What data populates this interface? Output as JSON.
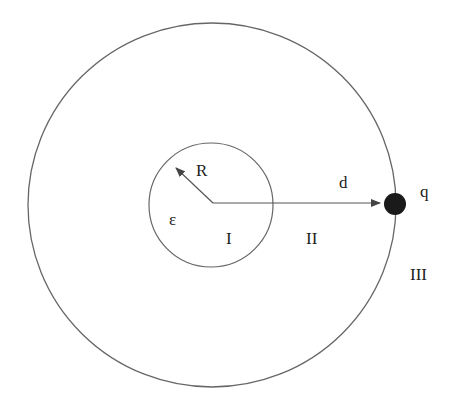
{
  "diagram": {
    "labels": {
      "radius": "R",
      "permittivity": "ε",
      "region1": "I",
      "region2": "II",
      "region3": "III",
      "distance": "d",
      "charge": "q"
    },
    "colors": {
      "stroke": "#666666",
      "charge": "#1a1a1a",
      "text": "#222222"
    }
  }
}
